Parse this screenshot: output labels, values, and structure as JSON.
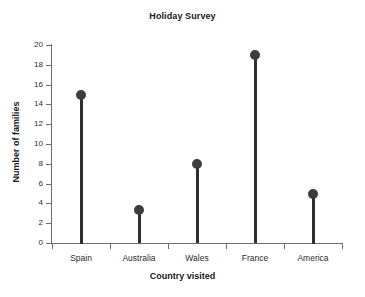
{
  "chart_data": {
    "type": "line",
    "title": "Holiday Survey",
    "xlabel": "Country visited",
    "ylabel": "Number of families",
    "categories": [
      "Spain",
      "Australia",
      "Wales",
      "France",
      "America"
    ],
    "values": [
      15,
      3.3,
      8,
      19,
      5
    ],
    "ylim": [
      0,
      20
    ],
    "yticks": [
      0,
      2,
      4,
      6,
      8,
      10,
      12,
      14,
      16,
      18,
      20
    ],
    "ytick_labels": [
      "0",
      "2",
      "4",
      "6",
      "8",
      "10",
      "12",
      "14",
      "16",
      "18",
      "20"
    ],
    "grid": false,
    "legend": false,
    "marker_color": "#3d3d3d",
    "stem_color": "#2e2e2e",
    "axis_color": "#6d6d6d",
    "background": "#ffffff",
    "note": "lollipop / stem plot: one filled circle marker per category atop a vertical stem rising from the zero baseline"
  }
}
